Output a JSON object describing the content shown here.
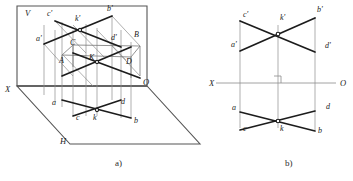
{
  "figure": {
    "captions": [
      {
        "id": "caption-a",
        "text": "a)",
        "x": 115,
        "y": 166
      },
      {
        "id": "caption-b",
        "text": "b)",
        "x": 285,
        "y": 166
      }
    ],
    "colors": {
      "bold_line": "#1c1c1c",
      "thin_line": "#8d8d8d",
      "axis": "#8a8a8a",
      "label": "#1a1a1a",
      "background": "#ffffff"
    }
  },
  "diagram_a": {
    "name": "pictorial-two-plane-projection",
    "plane_labels": [
      {
        "id": "plane-v",
        "text": "V",
        "x": 25,
        "y": 16
      },
      {
        "id": "plane-h",
        "text": "H",
        "x": 60,
        "y": 144
      },
      {
        "id": "axis-x",
        "text": "X",
        "x": 5,
        "y": 92
      },
      {
        "id": "axis-o",
        "text": "O",
        "x": 143,
        "y": 85
      }
    ],
    "points": [
      {
        "id": "c-prime",
        "text": "c'",
        "x": 47,
        "y": 16
      },
      {
        "id": "k-prime",
        "text": "k'",
        "x": 75,
        "y": 21
      },
      {
        "id": "b-prime",
        "text": "b'",
        "x": 107,
        "y": 11
      },
      {
        "id": "a-prime",
        "text": "a'",
        "x": 36,
        "y": 41
      },
      {
        "id": "d-prime",
        "text": "d'",
        "x": 111,
        "y": 40
      },
      {
        "id": "B-cap",
        "text": "B",
        "x": 134,
        "y": 37
      },
      {
        "id": "C-cap",
        "text": "C",
        "x": 70,
        "y": 45
      },
      {
        "id": "K-cap",
        "text": "K",
        "x": 89,
        "y": 60
      },
      {
        "id": "A-cap",
        "text": "A",
        "x": 59,
        "y": 63
      },
      {
        "id": "D-cap",
        "text": "D",
        "x": 126,
        "y": 64
      },
      {
        "id": "a-low",
        "text": "a",
        "x": 52,
        "y": 105
      },
      {
        "id": "d-low",
        "text": "d",
        "x": 121,
        "y": 104
      },
      {
        "id": "c-low",
        "text": "c",
        "x": 76,
        "y": 120
      },
      {
        "id": "k-low",
        "text": "k",
        "x": 93,
        "y": 120
      },
      {
        "id": "b-low",
        "text": "b",
        "x": 134,
        "y": 123
      }
    ]
  },
  "diagram_b": {
    "name": "orthographic-epure",
    "axis_labels": [
      {
        "id": "axis-x",
        "text": "X",
        "x": 209,
        "y": 86
      },
      {
        "id": "axis-o",
        "text": "O",
        "x": 340,
        "y": 86
      }
    ],
    "points": [
      {
        "id": "c-prime",
        "text": "c'",
        "x": 243,
        "y": 17
      },
      {
        "id": "k-prime",
        "text": "k'",
        "x": 280,
        "y": 20
      },
      {
        "id": "b-prime",
        "text": "b'",
        "x": 317,
        "y": 12
      },
      {
        "id": "a-prime",
        "text": "a'",
        "x": 231,
        "y": 47
      },
      {
        "id": "d-prime",
        "text": "d'",
        "x": 325,
        "y": 48
      },
      {
        "id": "a-low",
        "text": "a",
        "x": 232,
        "y": 110
      },
      {
        "id": "d-low",
        "text": "d",
        "x": 326,
        "y": 109
      },
      {
        "id": "c-low",
        "text": "c",
        "x": 243,
        "y": 131
      },
      {
        "id": "k-low",
        "text": "k",
        "x": 280,
        "y": 131
      },
      {
        "id": "b-low",
        "text": "b",
        "x": 318,
        "y": 133
      }
    ],
    "right_angle_mark": {
      "id": "right-angle-mark",
      "x": 277,
      "y": 72
    }
  }
}
